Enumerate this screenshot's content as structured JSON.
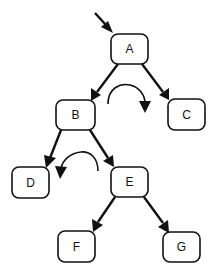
{
  "diagram": {
    "type": "binary-tree-rotation",
    "entry_arrow": {
      "from": [
        95,
        13
      ],
      "to": [
        112,
        32
      ],
      "target": "A"
    },
    "nodes": [
      {
        "id": "A",
        "label": "A",
        "x": 111,
        "y": 34,
        "w": 37,
        "h": 30
      },
      {
        "id": "B",
        "label": "B",
        "x": 56,
        "y": 100,
        "w": 39,
        "h": 30
      },
      {
        "id": "C",
        "label": "C",
        "x": 168,
        "y": 99,
        "w": 37,
        "h": 31
      },
      {
        "id": "D",
        "label": "D",
        "x": 12,
        "y": 167,
        "w": 37,
        "h": 31
      },
      {
        "id": "E",
        "label": "E",
        "x": 111,
        "y": 167,
        "w": 37,
        "h": 30
      },
      {
        "id": "F",
        "label": "F",
        "x": 58,
        "y": 231,
        "w": 37,
        "h": 31
      },
      {
        "id": "G",
        "label": "G",
        "x": 163,
        "y": 232,
        "w": 37,
        "h": 30
      }
    ],
    "edges": [
      {
        "from": "A",
        "to": "B"
      },
      {
        "from": "A",
        "to": "C"
      },
      {
        "from": "B",
        "to": "D"
      },
      {
        "from": "B",
        "to": "E"
      },
      {
        "from": "E",
        "to": "F"
      },
      {
        "from": "E",
        "to": "G"
      }
    ],
    "rotation_arrows": [
      {
        "name": "clockwise-arrow",
        "direction": "clockwise",
        "between": [
          "B",
          "C"
        ]
      },
      {
        "name": "counterclockwise-arrow",
        "direction": "counterclockwise",
        "between": [
          "D",
          "E"
        ]
      }
    ],
    "colors": {
      "stroke": "#111111",
      "background": "#ffffff"
    }
  }
}
